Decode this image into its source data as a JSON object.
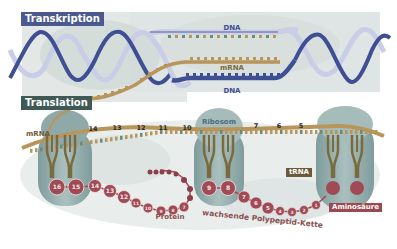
{
  "title_boxes": {
    "transcription": "Transkription",
    "translation": "Translation"
  },
  "labels": {
    "dna_top": "DNA",
    "mrna_top": "mRNA",
    "dna_bottom": "DNA",
    "mrna_left": "mRNA",
    "ribosome": "Ribosom",
    "trna": "tRNA",
    "amino_acid": "Aminosäure",
    "protein": "Protein",
    "growing_chain": "wachsende Polypeptid-Kette"
  },
  "codon_numbers": [
    "14",
    "13",
    "12",
    "11",
    "10",
    "7",
    "6",
    "5"
  ],
  "protein_beads": [
    "16",
    "15",
    "14",
    "13",
    "12",
    "11",
    "10",
    "9",
    "8",
    "7"
  ],
  "ribosome2_beads": [
    "9",
    "8"
  ],
  "chain_beads": [
    "7",
    "6",
    "5",
    "4",
    "3",
    "2",
    "1"
  ],
  "colors": {
    "dna_dark": "#3f4f93",
    "dna_light": "#c9cde6",
    "mrna": "#b8955a",
    "trna": "#7a6a3c",
    "ribosome": "#93afae",
    "bead": "#a04a55",
    "tag_blue": "#4a5a8e",
    "tag_green": "#3f5a55",
    "tag_brown": "#6b5a3a",
    "tag_red": "#9a4a50"
  }
}
